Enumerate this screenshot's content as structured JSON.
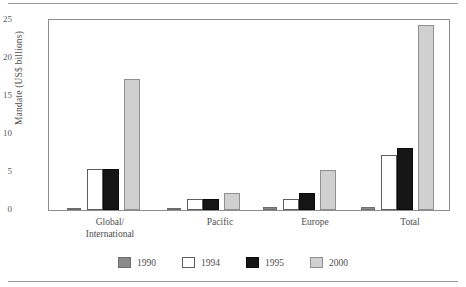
{
  "chart_data": {
    "type": "bar",
    "title": "",
    "xlabel": "",
    "ylabel": "Mandate (US$ billions)",
    "ylim": [
      0,
      25
    ],
    "yticks": [
      0,
      5,
      10,
      15,
      20,
      25
    ],
    "grid": false,
    "legend_position": "bottom",
    "categories": [
      "Global/\nInternational",
      "Pacific",
      "Europe",
      "Total"
    ],
    "series": [
      {
        "name": "1990",
        "color": "#8a8a8a",
        "values": [
          0.3,
          0.25,
          0.35,
          0.35
        ]
      },
      {
        "name": "1994",
        "color": "#ffffff",
        "values": [
          5.4,
          1.4,
          1.4,
          7.3
        ]
      },
      {
        "name": "1995",
        "color": "#151515",
        "values": [
          5.4,
          1.4,
          2.3,
          8.1
        ]
      },
      {
        "name": "2000",
        "color": "#d0d0d0",
        "values": [
          17.3,
          2.3,
          5.3,
          24.4
        ]
      }
    ]
  },
  "axis": {
    "y_title": "Mandate (US$ billions)",
    "y_tick_labels": [
      "25",
      "20",
      "15",
      "10",
      "5",
      "0"
    ],
    "x_tick_labels": [
      "Global/\nInternational",
      "Pacific",
      "Europe",
      "Total"
    ]
  },
  "legend": {
    "items": [
      {
        "label": "1990",
        "swatch": "gray-swatch"
      },
      {
        "label": "1994",
        "swatch": "white-swatch"
      },
      {
        "label": "1995",
        "swatch": "black-swatch"
      },
      {
        "label": "2000",
        "swatch": "light-gray-swatch"
      }
    ]
  }
}
